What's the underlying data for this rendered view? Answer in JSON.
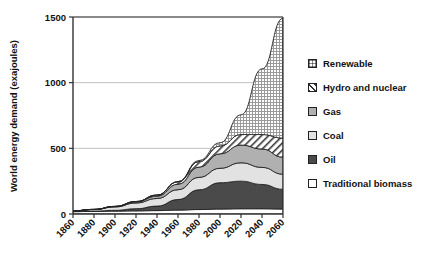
{
  "chart_data": {
    "type": "area",
    "title": "",
    "xlabel": "",
    "ylabel": "World energy demand (exajoules)",
    "xlim": [
      1860,
      2060
    ],
    "ylim": [
      0,
      1500
    ],
    "yticks": [
      0,
      500,
      1000,
      1500
    ],
    "xticks": [
      1860,
      1880,
      1900,
      1920,
      1940,
      1960,
      1980,
      2000,
      2020,
      2040,
      2060
    ],
    "grid": "horizontal",
    "stacked": true,
    "legend_position": "right",
    "x": [
      1860,
      1880,
      1900,
      1920,
      1940,
      1960,
      1980,
      2000,
      2020,
      2040,
      2060
    ],
    "series": [
      {
        "name": "Traditional biomass",
        "color": "#ffffff",
        "pattern": "solid",
        "values": [
          18,
          20,
          22,
          24,
          26,
          30,
          34,
          38,
          40,
          40,
          38
        ]
      },
      {
        "name": "Oil",
        "color": "#4a4a4a",
        "pattern": "solid",
        "values": [
          1,
          2,
          6,
          16,
          34,
          80,
          150,
          200,
          210,
          185,
          150
        ]
      },
      {
        "name": "Coal",
        "color": "#e2e2e2",
        "pattern": "solid",
        "values": [
          5,
          12,
          26,
          44,
          58,
          75,
          95,
          110,
          140,
          130,
          115
        ]
      },
      {
        "name": "Gas",
        "color": "#b0b0b0",
        "pattern": "solid",
        "values": [
          0,
          1,
          3,
          8,
          18,
          42,
          78,
          110,
          135,
          140,
          130
        ]
      },
      {
        "name": "Hydro and nuclear",
        "color": "#ffffff",
        "pattern": "diagonal-hatch",
        "values": [
          0,
          0,
          1,
          3,
          8,
          18,
          42,
          60,
          80,
          110,
          145
        ]
      },
      {
        "name": "Renewable",
        "color": "#d8d8d8",
        "pattern": "grid-dots",
        "values": [
          0,
          0,
          0,
          0,
          0,
          2,
          8,
          25,
          150,
          500,
          912
        ]
      }
    ],
    "totals": [
      24,
      35,
      58,
      95,
      144,
      247,
      407,
      543,
      755,
      1105,
      1490
    ]
  },
  "legend": {
    "items": [
      {
        "label": "Renewable",
        "swatch": "grid-dots"
      },
      {
        "label": "Hydro and nuclear",
        "swatch": "diagonal-hatch"
      },
      {
        "label": "Gas",
        "swatch": "solid-mid-gray"
      },
      {
        "label": "Coal",
        "swatch": "solid-light-gray"
      },
      {
        "label": "Oil",
        "swatch": "solid-dark-gray"
      },
      {
        "label": "Traditional biomass",
        "swatch": "solid-white"
      }
    ]
  }
}
